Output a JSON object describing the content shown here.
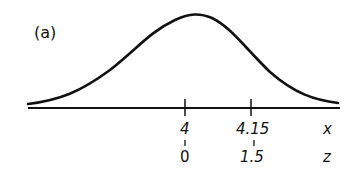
{
  "figure": {
    "panel_label": "(a)",
    "curve": "normal-distribution",
    "axes": {
      "x": {
        "label": "x",
        "ticks": [
          {
            "value": "4",
            "z": "0"
          },
          {
            "value": "4.15",
            "z": "1.5"
          }
        ]
      },
      "z": {
        "label": "z"
      }
    }
  }
}
